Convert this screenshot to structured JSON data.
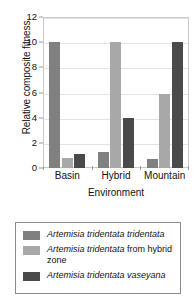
{
  "chart_data": {
    "type": "bar",
    "title": "",
    "xlabel": "Environment",
    "ylabel": "Relative composite fitness",
    "categories": [
      "Basin",
      "Hybrid",
      "Mountain"
    ],
    "ylim": [
      0,
      12
    ],
    "yticks": [
      "0",
      "2",
      "4",
      "6",
      "8",
      "10",
      "12"
    ],
    "grid": true,
    "legend_position": "below-plot",
    "series": [
      {
        "name": "Artemisia tridentata tridentata",
        "color": "#808080",
        "values": [
          10.0,
          1.25,
          0.7
        ]
      },
      {
        "name": "Artemisia tridentata from hybrid zone",
        "color": "#a8a8a8",
        "values": [
          0.8,
          10.0,
          5.9
        ]
      },
      {
        "name": "Artemisia tridentata vaseyana",
        "color": "#4a4a4a",
        "values": [
          1.1,
          4.0,
          10.0
        ]
      }
    ]
  },
  "axes": {
    "y_title": "Relative composite fitness",
    "x_title": "Environment",
    "y_tick_labels": [
      "0",
      "2",
      "4",
      "6",
      "8",
      "10",
      "12"
    ],
    "x_tick_labels": [
      "Basin",
      "Hybrid",
      "Mountain"
    ]
  },
  "legend": {
    "entries": [
      {
        "swatch_color": "#808080",
        "italic_part": "Artemisia tridentata tridentata",
        "roman_part": ""
      },
      {
        "swatch_color": "#a8a8a8",
        "italic_part": "Artemisia tridentata",
        "roman_part": " from hybrid zone"
      },
      {
        "swatch_color": "#4a4a4a",
        "italic_part": "Artemisia tridentata vaseyana",
        "roman_part": ""
      }
    ]
  }
}
